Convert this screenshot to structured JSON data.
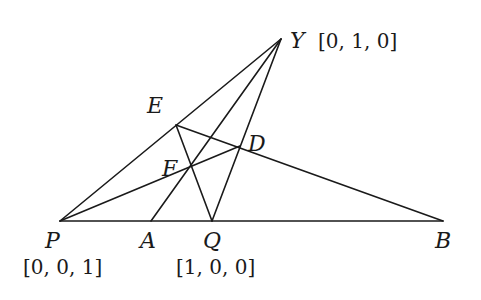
{
  "diagram": {
    "type": "projective-geometry-figure",
    "points": [
      {
        "id": "Y",
        "label": "Y",
        "x": 281,
        "y": 39,
        "coords": "[0, 1, 0]",
        "label_x": 290,
        "label_y": 48,
        "coords_x": 318,
        "coords_y": 48
      },
      {
        "id": "E",
        "label": "E",
        "x": 176,
        "y": 125,
        "label_x": 147,
        "label_y": 113
      },
      {
        "id": "D",
        "label": "D",
        "x": 240,
        "y": 146,
        "label_x": 248,
        "label_y": 151
      },
      {
        "id": "F",
        "label": "F",
        "x": 190,
        "y": 166,
        "label_x": 162,
        "label_y": 176
      },
      {
        "id": "P",
        "label": "P",
        "x": 60,
        "y": 221,
        "coords": "[0, 0, 1]",
        "label_x": 45,
        "label_y": 248,
        "coords_x": 23,
        "coords_y": 274
      },
      {
        "id": "A",
        "label": "A",
        "x": 151,
        "y": 221,
        "label_x": 140,
        "label_y": 248
      },
      {
        "id": "Q",
        "label": "Q",
        "x": 212,
        "y": 221,
        "coords": "[1, 0, 0]",
        "label_x": 203,
        "label_y": 248,
        "coords_x": 176,
        "coords_y": 274
      },
      {
        "id": "B",
        "label": "B",
        "x": 443,
        "y": 221,
        "label_x": 435,
        "label_y": 248
      }
    ],
    "segments": [
      {
        "from": "P",
        "to": "Y"
      },
      {
        "from": "P",
        "to": "B"
      },
      {
        "from": "Y",
        "to": "A"
      },
      {
        "from": "Y",
        "to": "Q"
      },
      {
        "from": "E",
        "to": "B"
      },
      {
        "from": "E",
        "to": "Q"
      },
      {
        "from": "P",
        "to": "D"
      }
    ],
    "labels": {
      "Y": "Y",
      "Y_coords": "[0, 1, 0]",
      "E": "E",
      "D": "D",
      "F": "F",
      "P": "P",
      "P_coords": "[0, 0, 1]",
      "A": "A",
      "Q": "Q",
      "Q_coords": "[1, 0, 0]",
      "B": "B"
    },
    "line_color": "#1a1a1a",
    "background_color": "#ffffff"
  }
}
